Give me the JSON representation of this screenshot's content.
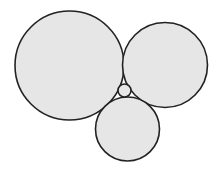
{
  "diagram": {
    "width": 216,
    "height": 172,
    "background": "#ffffff",
    "fill": "#e6e6e6",
    "stroke": "#222222",
    "stroke_width": 1.6,
    "circles": [
      {
        "id": "large-left",
        "cx": 69.5,
        "cy": 65.5,
        "r": 54.5
      },
      {
        "id": "right",
        "cx": 165,
        "cy": 65,
        "r": 42.5
      },
      {
        "id": "bottom",
        "cx": 127.5,
        "cy": 129,
        "r": 32
      },
      {
        "id": "small-center",
        "cx": 124.5,
        "cy": 90.5,
        "r": 6.5
      }
    ]
  }
}
